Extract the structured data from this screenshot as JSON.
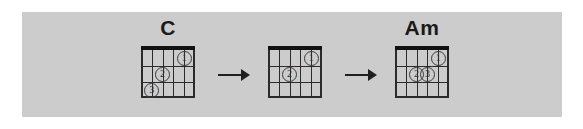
{
  "figure": {
    "panel_color": "#cccccc",
    "page_color": "#ffffff",
    "ink_color": "#1f1f1f"
  },
  "diagram": {
    "type": "chord-chart-sequence",
    "strings": 6,
    "frets": 3,
    "steps": [
      {
        "id": "step-1",
        "label": "C",
        "has_label": true,
        "fingers": [
          {
            "number": "1",
            "string": 2,
            "fret": 1
          },
          {
            "number": "2",
            "string": 4,
            "fret": 2
          },
          {
            "number": "3",
            "string": 5,
            "fret": 3
          }
        ]
      },
      {
        "id": "step-2",
        "label": "",
        "has_label": false,
        "fingers": [
          {
            "number": "1",
            "string": 2,
            "fret": 1
          },
          {
            "number": "2",
            "string": 4,
            "fret": 2
          }
        ]
      },
      {
        "id": "step-3",
        "label": "Am",
        "has_label": true,
        "fingers": [
          {
            "number": "1",
            "string": 2,
            "fret": 1
          },
          {
            "number": "2",
            "string": 4,
            "fret": 2
          },
          {
            "number": "3",
            "string": 3,
            "fret": 2
          }
        ]
      }
    ],
    "connectors": [
      {
        "id": "arrow-1",
        "glyph": "arrow-right"
      },
      {
        "id": "arrow-2",
        "glyph": "arrow-right"
      }
    ]
  }
}
